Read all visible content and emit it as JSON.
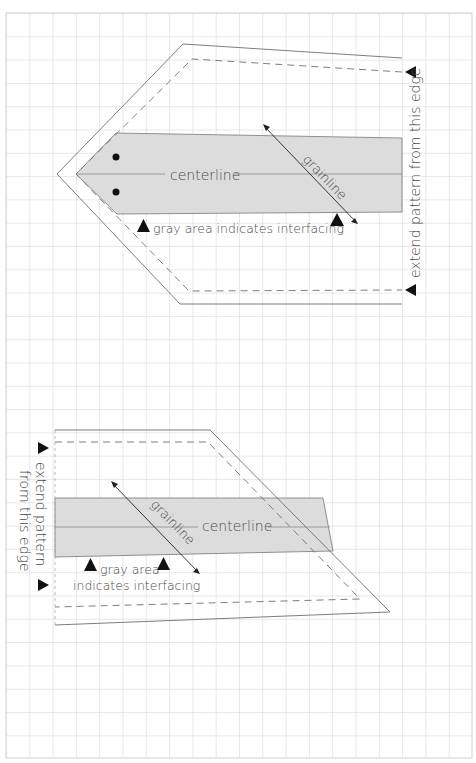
{
  "colors": {
    "grid": "#cfcfcf",
    "outline": "#6e6e6e",
    "interfacing": "#dcdcdc",
    "text": "#4a4a4a",
    "marker": "#111111"
  },
  "top_piece": {
    "centerline": "centerline",
    "grainline": "grainline",
    "interfacing_note": "gray area indicates interfacing",
    "edge_note": "extend pattern from this edge"
  },
  "bottom_piece": {
    "centerline": "centerline",
    "grainline": "grainline",
    "interfacing_note_line1": "gray area",
    "interfacing_note_line2": "indicates interfacing",
    "edge_note_line1": "extend pattern",
    "edge_note_line2": "from this edge"
  }
}
